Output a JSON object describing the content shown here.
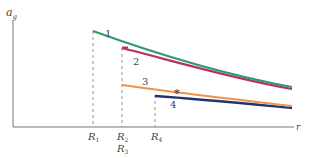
{
  "axes": {
    "y_label": "a",
    "y_label_sub": "g",
    "x_label": "r"
  },
  "ticks": [
    {
      "name": "R",
      "sub": "1",
      "x": 93
    },
    {
      "name": "R",
      "sub": "2",
      "x": 122
    },
    {
      "name": "R",
      "sub": "3",
      "x": 122
    },
    {
      "name": "R",
      "sub": "4",
      "x": 155
    }
  ],
  "curves": [
    {
      "id": "1",
      "label": "1",
      "color": "#2e9a6e"
    },
    {
      "id": "2",
      "label": "2",
      "color": "#b8325a"
    },
    {
      "id": "3",
      "label": "3",
      "color": "#f0934a"
    },
    {
      "id": "4",
      "label": "4",
      "color": "#22346e"
    }
  ],
  "marker": "*",
  "colors": {
    "axis": "#777777",
    "dashed": "#888888",
    "text": "#444444"
  }
}
